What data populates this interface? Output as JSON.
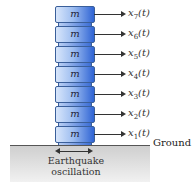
{
  "diagram": {
    "mass_label": "m",
    "floors": [
      {
        "sub": "7",
        "var": "x",
        "arg": "(t)"
      },
      {
        "sub": "6",
        "var": "x",
        "arg": "(t)"
      },
      {
        "sub": "5",
        "var": "x",
        "arg": "(t)"
      },
      {
        "sub": "4",
        "var": "x",
        "arg": "(t)"
      },
      {
        "sub": "3",
        "var": "x",
        "arg": "(t)"
      },
      {
        "sub": "2",
        "var": "x",
        "arg": "(t)"
      },
      {
        "sub": "1",
        "var": "x",
        "arg": "(t)"
      }
    ],
    "ground_label": "Ground",
    "oscillation_line1": "Earthquake",
    "oscillation_line2": "oscillation"
  }
}
